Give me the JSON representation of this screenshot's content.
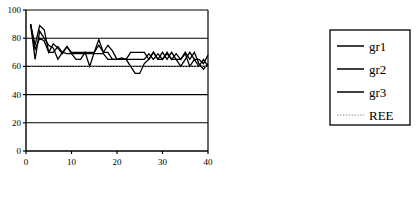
{
  "chart_data": {
    "type": "line",
    "title": "",
    "xlabel": "",
    "ylabel": "",
    "xlim": [
      0,
      40
    ],
    "ylim": [
      0,
      100
    ],
    "xticks": [
      0,
      10,
      20,
      30,
      40
    ],
    "yticks": [
      0,
      20,
      40,
      60,
      80,
      100
    ],
    "grid": true,
    "grid_axis": "y",
    "legend_position": "right",
    "x": [
      1,
      2,
      3,
      4,
      5,
      6,
      7,
      8,
      9,
      10,
      11,
      12,
      13,
      14,
      15,
      16,
      17,
      18,
      19,
      20,
      21,
      22,
      23,
      24,
      25,
      26,
      27,
      28,
      29,
      30,
      31,
      32,
      33,
      34,
      35,
      36,
      37,
      38,
      39,
      40
    ],
    "series": [
      {
        "name": "gr1",
        "style": "solid",
        "color": "#000000",
        "values": [
          90,
          65,
          85,
          80,
          75,
          73,
          65,
          70,
          74,
          69,
          65,
          65,
          70,
          60,
          70,
          75,
          70,
          70,
          65,
          65,
          65,
          65,
          70,
          70,
          70,
          70,
          65,
          70,
          65,
          70,
          65,
          70,
          65,
          60,
          65,
          70,
          65,
          65,
          62,
          68
        ]
      },
      {
        "name": "gr2",
        "style": "solid",
        "color": "#000000",
        "values": [
          90,
          75,
          89,
          86,
          70,
          76,
          73,
          69,
          74,
          70,
          70,
          70,
          70,
          70,
          70,
          79,
          70,
          75,
          71,
          65,
          66,
          65,
          60,
          55,
          55,
          62,
          65,
          70,
          65,
          65,
          70,
          65,
          65,
          65,
          70,
          65,
          70,
          62,
          58,
          62
        ]
      },
      {
        "name": "gr3",
        "style": "solid",
        "color": "#000000",
        "values": [
          90,
          72,
          80,
          78,
          70,
          70,
          74,
          70,
          69,
          69,
          69,
          69,
          69,
          69,
          69,
          69,
          69,
          65,
          65,
          65,
          65,
          65,
          65,
          65,
          65,
          65,
          69,
          65,
          69,
          65,
          69,
          65,
          69,
          65,
          69,
          60,
          65,
          60,
          65,
          60
        ]
      },
      {
        "name": "REE",
        "style": "dotted",
        "color": "#808080",
        "constant": 60,
        "values": [
          60,
          60,
          60,
          60,
          60,
          60,
          60,
          60,
          60,
          60,
          60,
          60,
          60,
          60,
          60,
          60,
          60,
          60,
          60,
          60,
          60,
          60,
          60,
          60,
          60,
          60,
          60,
          60,
          60,
          60,
          60,
          60,
          60,
          60,
          60,
          60,
          60,
          60,
          60,
          60
        ]
      }
    ]
  },
  "legend": {
    "entries": [
      {
        "label": "gr1",
        "style": "solid"
      },
      {
        "label": "gr2",
        "style": "solid"
      },
      {
        "label": "gr3",
        "style": "solid"
      },
      {
        "label": "REE",
        "style": "dotted"
      }
    ]
  },
  "axes": {
    "y_tick_labels": [
      "100",
      "80",
      "60",
      "40",
      "20",
      "0"
    ],
    "x_tick_labels": [
      "0",
      "10",
      "20",
      "30",
      "40"
    ]
  },
  "colors": {
    "line": "#000000",
    "reference_line": "#808080",
    "axis": "#000000",
    "grid": "#000000",
    "background": "#ffffff"
  }
}
